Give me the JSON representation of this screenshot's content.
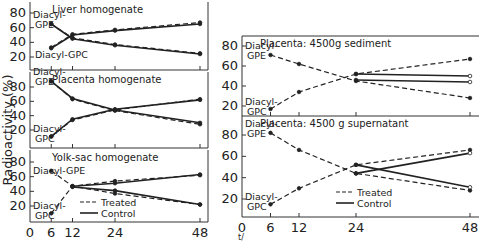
{
  "ylabel": "Radioactivity (%)",
  "xlabel_fragment": "t/",
  "legend": {
    "treated": "Treated",
    "control": "Control"
  },
  "x_ticks": [
    "0",
    "6",
    "12",
    "24",
    "48"
  ],
  "y_ticks": [
    "20",
    "40",
    "60",
    "80"
  ],
  "panels": [
    {
      "title": "Liver homogenate",
      "gpe_label": "Diacyl-GPE",
      "gpc_label": "Diacyl-GPC"
    },
    {
      "title": "Placenta homogenate",
      "gpe_label": "Diacyl-GPE",
      "gpc_label": "Diacyl-GPC"
    },
    {
      "title": "Yolk-sac homogenate",
      "gpe_label": "Diacyl-GPE",
      "gpc_label": "Diacyl-GPC"
    },
    {
      "title": "Placenta: 4500g sediment",
      "gpe_label": "Diacyl-GPE",
      "gpc_label": "Diacyl-GPC"
    },
    {
      "title": "Placenta: 4500 g supernatant",
      "gpe_label": "Diacyl-GPE",
      "gpc_label": "Diacyl-GPC"
    }
  ],
  "chart_data": [
    {
      "type": "line",
      "title": "Liver homogenate",
      "xlabel": "t (h)",
      "ylabel": "Radioactivity (%)",
      "ylim": [
        0,
        90
      ],
      "xlim": [
        0,
        48
      ],
      "x": [
        6,
        12,
        24,
        48
      ],
      "series": [
        {
          "name": "Diacyl-GPE Treated",
          "values": [
            65,
            46,
            37,
            25
          ]
        },
        {
          "name": "Diacyl-GPE Control",
          "values": [
            65,
            45,
            36,
            24
          ]
        },
        {
          "name": "Diacyl-GPC Treated",
          "values": [
            33,
            51,
            57,
            67
          ]
        },
        {
          "name": "Diacyl-GPC Control",
          "values": [
            32,
            50,
            56,
            65
          ]
        }
      ]
    },
    {
      "type": "line",
      "title": "Placenta homogenate",
      "xlabel": "t (h)",
      "ylabel": "Radioactivity (%)",
      "ylim": [
        0,
        90
      ],
      "xlim": [
        0,
        48
      ],
      "x": [
        6,
        12,
        24,
        48
      ],
      "series": [
        {
          "name": "Diacyl-GPE Treated",
          "values": [
            88,
            63,
            47,
            28
          ]
        },
        {
          "name": "Diacyl-GPE Control",
          "values": [
            88,
            64,
            48,
            30
          ]
        },
        {
          "name": "Diacyl-GPC Treated",
          "values": [
            11,
            34,
            48,
            63
          ]
        },
        {
          "name": "Diacyl-GPC Control",
          "values": [
            11,
            35,
            49,
            62
          ]
        }
      ]
    },
    {
      "type": "line",
      "title": "Yolk-sac homogenate",
      "xlabel": "t (h)",
      "ylabel": "Radioactivity (%)",
      "ylim": [
        0,
        90
      ],
      "xlim": [
        0,
        48
      ],
      "x": [
        6,
        12,
        24,
        48
      ],
      "series": [
        {
          "name": "Diacyl-GPE Treated",
          "values": [
            68,
            47,
            37,
            22
          ]
        },
        {
          "name": "Diacyl-GPE Control",
          "values": [
            null,
            46,
            41,
            22
          ]
        },
        {
          "name": "Diacyl-GPC Treated",
          "values": [
            10,
            47,
            54,
            62
          ]
        },
        {
          "name": "Diacyl-GPC Control",
          "values": [
            null,
            47,
            51,
            63
          ]
        }
      ]
    },
    {
      "type": "line",
      "title": "Placenta: 4500g sediment",
      "xlabel": "t (h)",
      "ylabel": "Radioactivity (%)",
      "ylim": [
        0,
        90
      ],
      "xlim": [
        0,
        48
      ],
      "x": [
        6,
        12,
        24,
        48
      ],
      "series": [
        {
          "name": "Diacyl-GPE Treated",
          "values": [
            71,
            62,
            45,
            28
          ]
        },
        {
          "name": "Diacyl-GPE Control",
          "values": [
            null,
            null,
            52,
            50
          ]
        },
        {
          "name": "Diacyl-GPC Treated",
          "values": [
            17,
            34,
            52,
            67
          ]
        },
        {
          "name": "Diacyl-GPC Control",
          "values": [
            null,
            null,
            46,
            44
          ]
        }
      ]
    },
    {
      "type": "line",
      "title": "Placenta: 4500 g supernatant",
      "xlabel": "t (h)",
      "ylabel": "Radioactivity (%)",
      "ylim": [
        0,
        90
      ],
      "xlim": [
        0,
        48
      ],
      "x": [
        6,
        12,
        24,
        48
      ],
      "series": [
        {
          "name": "Diacyl-GPE Treated",
          "values": [
            82,
            66,
            44,
            28
          ]
        },
        {
          "name": "Diacyl-GPE Control",
          "values": [
            null,
            null,
            52,
            31
          ]
        },
        {
          "name": "Diacyl-GPC Treated",
          "values": [
            15,
            30,
            52,
            66
          ]
        },
        {
          "name": "Diacyl-GPC Control",
          "values": [
            null,
            null,
            44,
            63
          ]
        }
      ]
    }
  ]
}
